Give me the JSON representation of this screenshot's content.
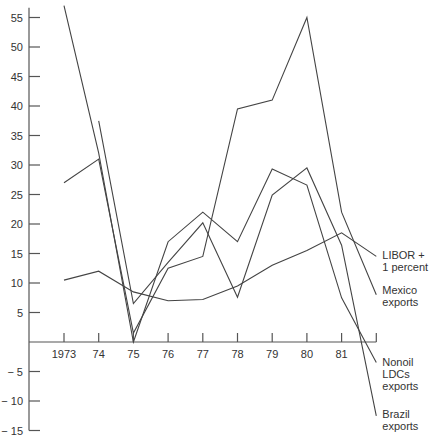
{
  "chart_data": {
    "type": "line",
    "title": "",
    "xlabel": "",
    "ylabel": "",
    "x": [
      1973,
      1974,
      1975,
      1976,
      1977,
      1978,
      1979,
      1980,
      1981,
      1982
    ],
    "x_tick_labels": [
      "1973",
      "74",
      "75",
      "76",
      "77",
      "78",
      "79",
      "80",
      "81",
      ""
    ],
    "y_ticks": [
      55,
      50,
      45,
      40,
      35,
      30,
      25,
      20,
      15,
      10,
      5,
      -5,
      -10,
      -15
    ],
    "y_tick_labels": [
      "55",
      "50",
      "45",
      "40",
      "35",
      "30",
      "25",
      "20",
      "15",
      "10",
      "5",
      "− 5",
      "− 10",
      "− 15"
    ],
    "ylim": [
      -15,
      57
    ],
    "xlim": [
      1972,
      1982
    ],
    "grid": false,
    "legend": "direct labels at right end of each line",
    "series": [
      {
        "name": "LIBOR + 1 percent",
        "label_lines": [
          "LIBOR +",
          "1 percent"
        ],
        "x": [
          1973,
          1974,
          1975,
          1976,
          1977,
          1978,
          1979,
          1980,
          1981,
          1982
        ],
        "values": [
          10.5,
          12,
          8.5,
          7,
          7.2,
          9.5,
          13,
          15.5,
          18.5,
          14.5
        ]
      },
      {
        "name": "Mexico exports",
        "label_lines": [
          "Mexico",
          "exports"
        ],
        "x": [
          1973,
          1974,
          1975,
          1976,
          1977,
          1978,
          1979,
          1980,
          1981,
          1982
        ],
        "values": [
          27,
          31,
          1.5,
          12.5,
          14.5,
          39.5,
          41,
          55,
          22,
          8
        ]
      },
      {
        "name": "Nonoil LDCs exports",
        "label_lines": [
          "Nonoil",
          "LDCs",
          "exports"
        ],
        "x": [
          1973,
          1974,
          1975,
          1976,
          1977,
          1978,
          1979,
          1980,
          1981,
          1982
        ],
        "values": [
          57,
          32,
          0,
          17,
          22,
          17,
          29.3,
          26.6,
          7.5,
          -3.5
        ]
      },
      {
        "name": "Brazil exports",
        "label_lines": [
          "Brazil",
          "exports"
        ],
        "x": [
          1974,
          1975,
          1976,
          1977,
          1978,
          1979,
          1980,
          1981,
          1982
        ],
        "values": [
          37.5,
          6.5,
          13.5,
          20.2,
          7.6,
          24.9,
          29.5,
          16.4,
          -12.5
        ]
      }
    ]
  }
}
